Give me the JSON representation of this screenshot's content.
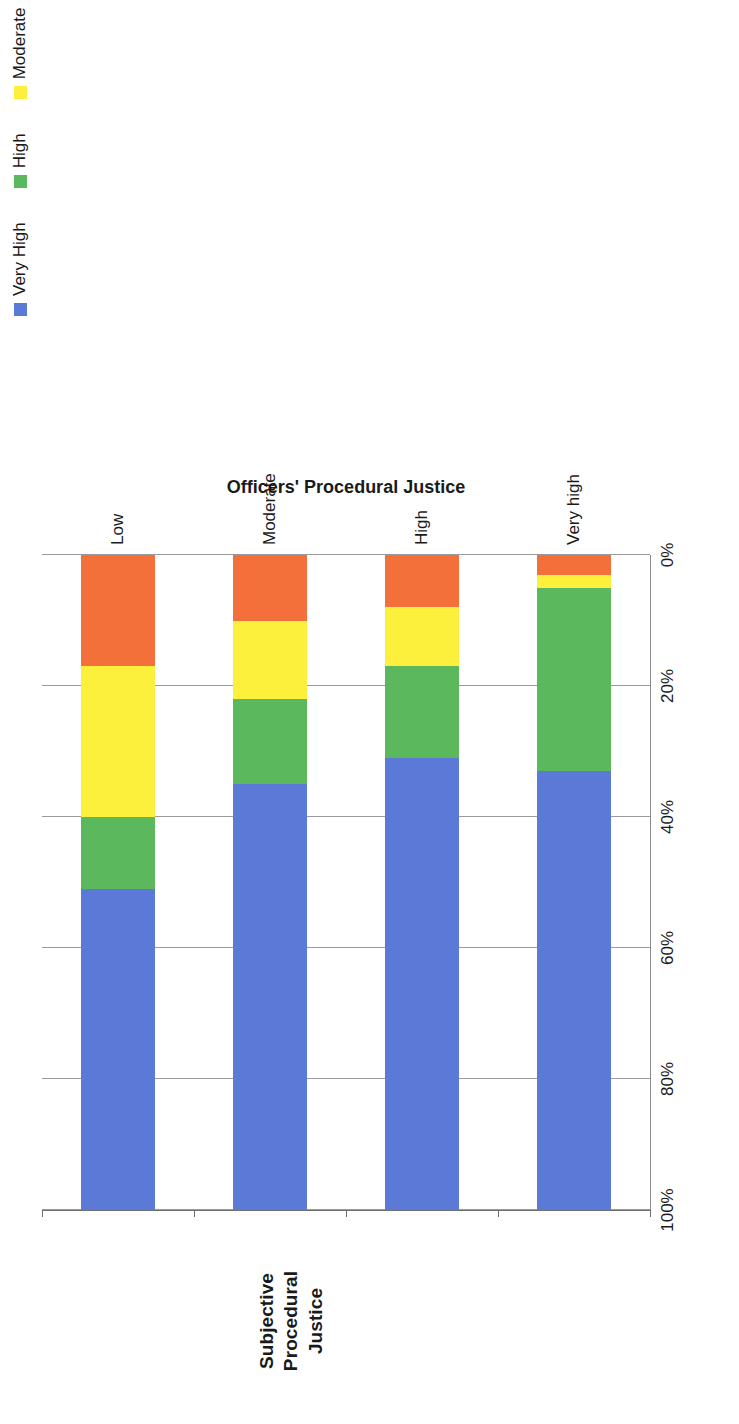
{
  "chart_data": {
    "type": "bar",
    "subtype": "100% stacked horizontal bar",
    "title": "",
    "xlabel": "",
    "ylabel": "Officers' Procedural Justice",
    "value_axis_title_line1": "Subjective Procedural",
    "value_axis_title_line2": "Justice",
    "categories": [
      "Low",
      "Moderate",
      "High",
      "Very high"
    ],
    "series": [
      {
        "name": "Low",
        "color": "#f4703a",
        "values": [
          17,
          10,
          8,
          3
        ]
      },
      {
        "name": "Moderate",
        "color": "#fcf03c",
        "values": [
          23,
          12,
          9,
          2
        ]
      },
      {
        "name": "High",
        "color": "#5cb85c",
        "values": [
          11,
          13,
          14,
          28
        ]
      },
      {
        "name": "Very High",
        "color": "#5b79d6",
        "values": [
          49,
          65,
          69,
          67
        ]
      }
    ],
    "legend": {
      "position": "right",
      "entries": [
        {
          "label": "Very High",
          "color": "#5b79d6"
        },
        {
          "label": "High",
          "color": "#5cb85c"
        },
        {
          "label": "Moderate",
          "color": "#fcf03c"
        },
        {
          "label": "Low",
          "color": "#f4703a"
        }
      ]
    },
    "xticks": [
      "0%",
      "20%",
      "40%",
      "60%",
      "80%",
      "100%"
    ],
    "xtick_values": [
      0,
      20,
      40,
      60,
      80,
      100
    ],
    "xlim": [
      0,
      100
    ],
    "grid": true,
    "grid_axis": "value"
  }
}
